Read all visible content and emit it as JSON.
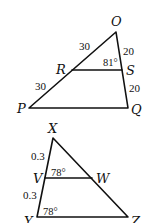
{
  "figures": [
    {
      "name": "triangle-OPQ",
      "vertices": {
        "O": {
          "label": "O",
          "x": 116,
          "y": 32
        },
        "P": {
          "label": "P",
          "x": 29,
          "y": 108
        },
        "Q": {
          "label": "Q",
          "x": 128,
          "y": 108
        },
        "R": {
          "label": "R",
          "x": 72,
          "y": 70
        },
        "S": {
          "label": "S",
          "x": 122,
          "y": 70
        }
      },
      "segment_labels": {
        "OR": "30",
        "RP": "30",
        "OS": "20",
        "SQ": "20"
      },
      "angle_labels": {
        "RSO": "81°"
      }
    },
    {
      "name": "triangle-XYZ",
      "vertices": {
        "X": {
          "label": "X",
          "x": 53,
          "y": 138
        },
        "V": {
          "label": "V",
          "x": 45,
          "y": 178
        },
        "W": {
          "label": "W",
          "x": 92,
          "y": 178
        },
        "Y": {
          "label": "Y",
          "x": 37,
          "y": 217
        },
        "Z": {
          "label": "Z",
          "x": 128,
          "y": 217
        }
      },
      "segment_labels": {
        "XV": "0.3",
        "VY": "0.3"
      },
      "angle_labels": {
        "XVW": "78°",
        "XYZ": "78°"
      }
    }
  ]
}
